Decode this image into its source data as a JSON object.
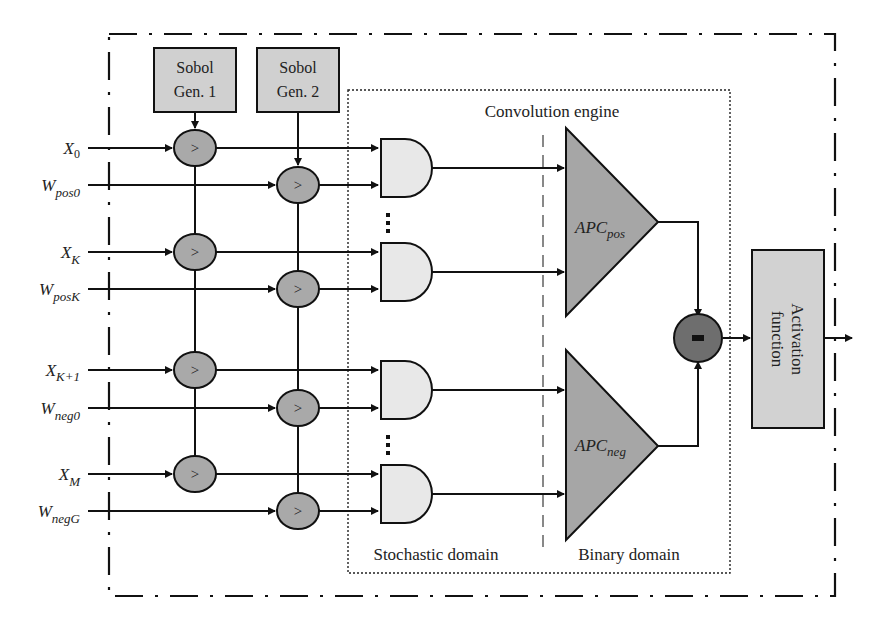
{
  "diagram": {
    "generators": [
      {
        "line1": "Sobol",
        "line2": "Gen. 1"
      },
      {
        "line1": "Sobol",
        "line2": "Gen. 2"
      }
    ],
    "inputs": [
      {
        "base": "X",
        "sub": "0"
      },
      {
        "base": "W",
        "sub": "pos0"
      },
      {
        "base": "X",
        "sub": "K"
      },
      {
        "base": "W",
        "sub": "posK"
      },
      {
        "base": "X",
        "sub": "K+1"
      },
      {
        "base": "W",
        "sub": "neg0"
      },
      {
        "base": "X",
        "sub": "M"
      },
      {
        "base": "W",
        "sub": "negG"
      }
    ],
    "comparator_symbol": ">",
    "ellipsis": "⋮",
    "engine_label": "Convolution engine",
    "apc": [
      {
        "base": "APC",
        "sub": "pos"
      },
      {
        "base": "APC",
        "sub": "neg"
      }
    ],
    "subtractor_symbol": "-",
    "activation": {
      "line1": "Activation",
      "line2": "function"
    },
    "domains": {
      "stochastic": "Stochastic domain",
      "binary": "Binary domain"
    },
    "colors": {
      "stroke": "#111111",
      "generator_fill": "#d0d0d0",
      "comparator_fill": "#a9a9a9",
      "and_fill": "#e8e8e8",
      "apc_fill": "#a6a6a6",
      "subtractor_fill": "#6e6e6e",
      "activation_fill": "#d2d2d2",
      "domain_divider": "#888888"
    }
  }
}
